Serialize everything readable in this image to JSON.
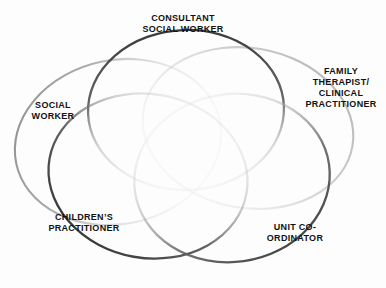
{
  "diagram": {
    "type": "venn",
    "background_color": "#fdfdfd",
    "text_color": "#121212",
    "title": "",
    "sets": [
      {
        "id": "consultant-social-worker",
        "label": "CONSULTANT\nSOCIAL WORKER",
        "position": "top-center",
        "stroke_color": "#3a3a3a",
        "stroke_shade": "dark"
      },
      {
        "id": "social-worker",
        "label": "SOCIAL\nWORKER",
        "position": "left",
        "stroke_color": "#8a8a8a",
        "stroke_shade": "medium"
      },
      {
        "id": "family-therapist-clinical-practitioner",
        "label": "FAMILY\nTHERAPIST/\nCLINICAL\nPRACTITIONER",
        "position": "right",
        "stroke_color": "#b4b4b4",
        "stroke_shade": "light"
      },
      {
        "id": "childrens-practitioner",
        "label": "CHILDREN’S\nPRACTITIONER",
        "position": "bottom-left",
        "stroke_color": "#3a3a3a",
        "stroke_shade": "dark"
      },
      {
        "id": "unit-coordinator",
        "label": "UNIT CO-\nORDINATOR",
        "position": "bottom-right",
        "stroke_color": "#6e6e6e",
        "stroke_shade": "medium-dark"
      }
    ]
  }
}
